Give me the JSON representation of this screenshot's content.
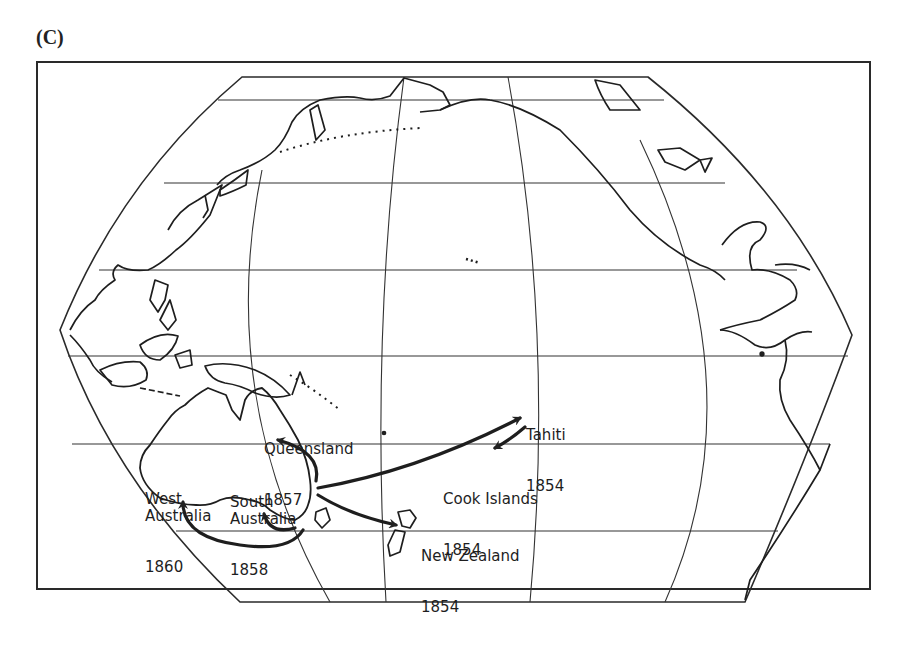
{
  "figure": {
    "panel_label": "(C)",
    "projection": "Pacific-centred pseudo-cylindrical world map with graticule",
    "colors": {
      "ink": "#222222",
      "background": "#ffffff"
    }
  },
  "map": {
    "labels": [
      {
        "id": "queensland",
        "name": "Queensland",
        "year": "1857"
      },
      {
        "id": "west-australia",
        "name": "West Australia",
        "year": "1860"
      },
      {
        "id": "south-australia",
        "name": "South Australia",
        "year": "1858"
      },
      {
        "id": "tahiti",
        "name": "Tahiti",
        "year": "1854"
      },
      {
        "id": "cook-islands",
        "name": "Cook Islands",
        "year": "1854"
      },
      {
        "id": "new-zealand",
        "name": "New Zealand",
        "year": "1854"
      }
    ],
    "routes": [
      {
        "from": "New South Wales (SE Australia)",
        "to": "Queensland",
        "year": "1857"
      },
      {
        "from": "New South Wales (SE Australia)",
        "to": "Tahiti",
        "year": "1854"
      },
      {
        "from": "Tahiti",
        "to": "Cook Islands",
        "year": "1854"
      },
      {
        "from": "New South Wales (SE Australia)",
        "to": "New Zealand",
        "year": "1854"
      },
      {
        "from": "Victoria / Tasmania",
        "to": "South Australia",
        "year": "1858"
      },
      {
        "from": "Victoria / Tasmania",
        "to": "West Australia",
        "year": "1860"
      }
    ]
  }
}
